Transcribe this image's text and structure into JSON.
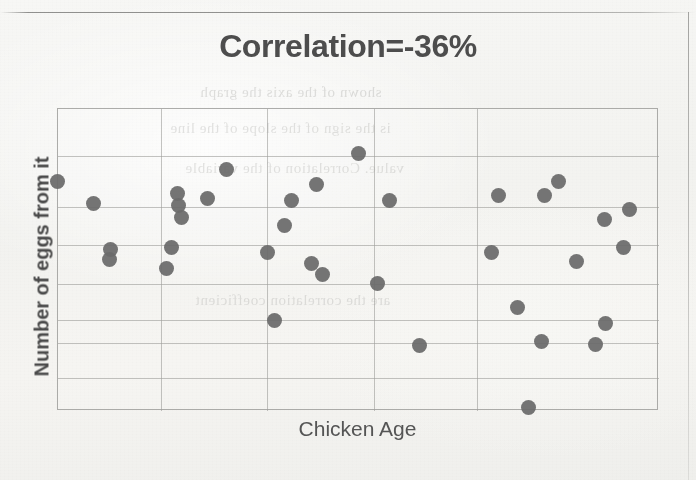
{
  "page": {
    "background_color": "#f3f3f0",
    "ink_color": "#6b6b6b",
    "grid_color": "#9e9e9b"
  },
  "chart": {
    "title": "Correlation=-36%",
    "xlabel": "Chicken Age",
    "ylabel": "Number of eggs from it"
  },
  "ghost": {
    "line1": "shown of the axis the graph",
    "line2": "is the sign of the slope of the line",
    "line3": "value. Correlation of the variable",
    "line4": "are the correlation coefficient"
  },
  "chart_data": {
    "type": "scatter",
    "title": "Correlation=-36%",
    "xlabel": "Chicken Age",
    "ylabel": "Number of eggs from it",
    "correlation": -0.36,
    "correlation_label": "-36%",
    "xlim": [
      0,
      10
    ],
    "ylim": [
      0,
      10
    ],
    "xticks": [],
    "yticks": [],
    "grid": true,
    "grid_x_positions": [
      1.72,
      3.47,
      5.25,
      6.97
    ],
    "grid_y_positions": [
      1.1,
      2.25,
      3.0,
      4.2,
      5.5,
      6.75,
      8.45
    ],
    "legend": null,
    "marker": {
      "shape": "circle",
      "color": "#6b6b6b",
      "size": 15
    },
    "points": [
      {
        "px": 56,
        "py": 180
      },
      {
        "px": 92,
        "py": 202
      },
      {
        "px": 109,
        "py": 248
      },
      {
        "px": 108,
        "py": 258
      },
      {
        "px": 165,
        "py": 267
      },
      {
        "px": 170,
        "py": 246
      },
      {
        "px": 176,
        "py": 192
      },
      {
        "px": 177,
        "py": 204
      },
      {
        "px": 180,
        "py": 216
      },
      {
        "px": 206,
        "py": 197
      },
      {
        "px": 225,
        "py": 168
      },
      {
        "px": 266,
        "py": 251
      },
      {
        "px": 273,
        "py": 319
      },
      {
        "px": 283,
        "py": 224
      },
      {
        "px": 290,
        "py": 199
      },
      {
        "px": 310,
        "py": 262
      },
      {
        "px": 315,
        "py": 183
      },
      {
        "px": 321,
        "py": 273
      },
      {
        "px": 357,
        "py": 152
      },
      {
        "px": 376,
        "py": 282
      },
      {
        "px": 388,
        "py": 199
      },
      {
        "px": 418,
        "py": 344
      },
      {
        "px": 490,
        "py": 251
      },
      {
        "px": 497,
        "py": 194
      },
      {
        "px": 516,
        "py": 306
      },
      {
        "px": 527,
        "py": 406
      },
      {
        "px": 540,
        "py": 340
      },
      {
        "px": 543,
        "py": 194
      },
      {
        "px": 557,
        "py": 180
      },
      {
        "px": 575,
        "py": 260
      },
      {
        "px": 594,
        "py": 343
      },
      {
        "px": 603,
        "py": 218
      },
      {
        "px": 604,
        "py": 322
      },
      {
        "px": 622,
        "py": 246
      },
      {
        "px": 628,
        "py": 208
      }
    ]
  }
}
